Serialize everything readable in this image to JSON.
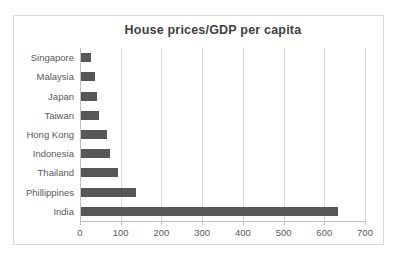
{
  "chart_data": {
    "type": "bar",
    "orientation": "horizontal",
    "title": "House prices/GDP per capita",
    "categories": [
      "Singapore",
      "Malaysia",
      "Japan",
      "Taiwan",
      "Hong Kong",
      "Indonesia",
      "Thailand",
      "Phillippines",
      "India"
    ],
    "values": [
      25,
      35,
      40,
      45,
      65,
      70,
      90,
      135,
      630
    ],
    "category_order": "top-to-bottom",
    "xlabel": "",
    "ylabel": "",
    "xlim": [
      0,
      700
    ],
    "x_ticks": [
      0,
      100,
      200,
      300,
      400,
      500,
      600,
      700
    ],
    "grid": true,
    "legend": false,
    "colors": {
      "bar": "#575757",
      "title": "#3f3f3f",
      "axis_text": "#595959",
      "gridline": "#d9d9d9",
      "axis_line": "#bfbfbf",
      "frame_border": "#d9d9d9",
      "background": "#ffffff"
    }
  }
}
